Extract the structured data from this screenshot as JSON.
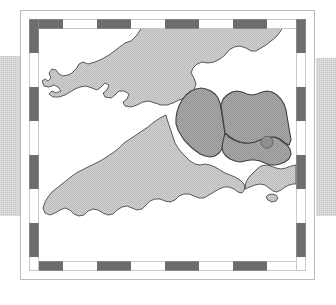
{
  "figure": {
    "kind": "decorative-framed-map",
    "title": "",
    "caption": "",
    "region_depicted": "South West England and South Wales",
    "background_color": "#ffffff"
  },
  "frame": {
    "outer_border_color": "#b9b9b9",
    "dash_color": "#6d6d6d",
    "dash_gap_color": "#ffffff",
    "dash_segment_px": 34,
    "style_name": "checkered-dashed-border"
  },
  "side_bands": {
    "color": "#c6c6c6",
    "left_label": "left-decorative-band",
    "right_label": "right-decorative-band"
  },
  "map": {
    "sea_color": "#ffffff",
    "land_color": "#cacaca",
    "land_stipple": true,
    "highlight_color": "#a2a2a2",
    "coastline_color": "#4a4a4a",
    "boundary_color": "#555555",
    "marker": {
      "label": "location-marker",
      "color": "#8f8f8f",
      "outline_color": "#5a5a5a",
      "x_pct": 88.7,
      "y_pct": 48.8,
      "radius_px": 6
    },
    "areas": [
      {
        "name": "wales",
        "fill": "land",
        "label": ""
      },
      {
        "name": "cornwall-devon",
        "fill": "land",
        "label": ""
      },
      {
        "name": "dorset-hampshire",
        "fill": "land",
        "label": ""
      },
      {
        "name": "somerset-highlight",
        "fill": "highlight",
        "label": ""
      },
      {
        "name": "wiltshire-highlight",
        "fill": "highlight",
        "label": ""
      },
      {
        "name": "isle-of-wight",
        "fill": "land",
        "label": ""
      }
    ]
  }
}
